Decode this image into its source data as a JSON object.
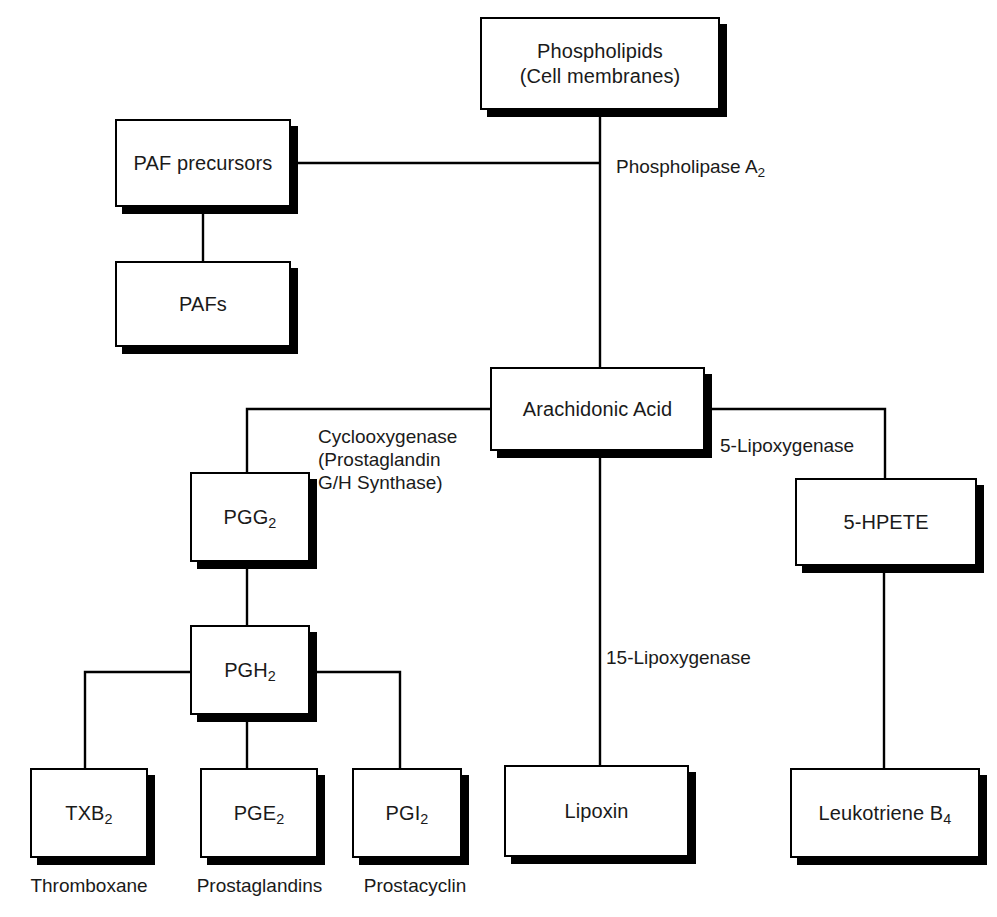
{
  "diagram": {
    "colors": {
      "box_fill": "#ffffff",
      "box_border": "#000000",
      "shadow": "#000000",
      "text": "#1a1a1a",
      "line": "#000000",
      "background": "#ffffff"
    },
    "nodes": [
      {
        "id": "phospholipids",
        "label": "Phospholipids\n(Cell membranes)",
        "x": 480,
        "y": 17,
        "w": 240,
        "h": 93
      },
      {
        "id": "paf_precursors",
        "label": "PAF precursors",
        "x": 115,
        "y": 119,
        "w": 176,
        "h": 88
      },
      {
        "id": "pafs",
        "label": "PAFs",
        "x": 115,
        "y": 261,
        "w": 176,
        "h": 86
      },
      {
        "id": "arachidonic",
        "label": "Arachidonic Acid",
        "x": 490,
        "y": 367,
        "w": 215,
        "h": 84
      },
      {
        "id": "pgg2",
        "label": "PGG₂",
        "x": 190,
        "y": 472,
        "w": 120,
        "h": 90
      },
      {
        "id": "hpete",
        "label": "5-HPETE",
        "x": 795,
        "y": 478,
        "w": 182,
        "h": 88
      },
      {
        "id": "pgh2",
        "label": "PGH₂",
        "x": 190,
        "y": 625,
        "w": 120,
        "h": 90
      },
      {
        "id": "txb2",
        "label": "TXB₂",
        "x": 30,
        "y": 768,
        "w": 118,
        "h": 90
      },
      {
        "id": "pge2",
        "label": "PGE₂",
        "x": 200,
        "y": 768,
        "w": 118,
        "h": 90
      },
      {
        "id": "pgi2",
        "label": "PGI₂",
        "x": 352,
        "y": 768,
        "w": 110,
        "h": 90
      },
      {
        "id": "lipoxin",
        "label": "Lipoxin",
        "x": 504,
        "y": 765,
        "w": 185,
        "h": 92
      },
      {
        "id": "leukotriene",
        "label": "Leukotriene B₄",
        "x": 790,
        "y": 768,
        "w": 190,
        "h": 90
      }
    ],
    "edge_labels": [
      {
        "id": "phospholipase_a2",
        "text": "Phospholipase A₂",
        "x": 616,
        "y": 155
      },
      {
        "id": "cyclooxygenase",
        "text": "Cyclooxygenase\n(Prostaglandin\nG/H Synthase)",
        "x": 318,
        "y": 425
      },
      {
        "id": "lipoxygenase_5",
        "text": "5-Lipoxygenase",
        "x": 720,
        "y": 434
      },
      {
        "id": "lipoxygenase_15",
        "text": "15-Lipoxygenase",
        "x": 606,
        "y": 646
      }
    ],
    "captions": [
      {
        "id": "thromboxane",
        "text": "Thromboxane",
        "x": 9,
        "y": 875,
        "w": 160
      },
      {
        "id": "prostaglandins",
        "text": "Prostaglandins",
        "x": 177,
        "y": 875,
        "w": 165
      },
      {
        "id": "prostacyclin",
        "text": "Prostacyclin",
        "x": 340,
        "y": 875,
        "w": 150
      }
    ],
    "connections": [
      {
        "id": "phospholipids-to-arachidonic",
        "from": "phospholipids",
        "to": "arachidonic",
        "path": "M 600 110 L 600 367"
      },
      {
        "id": "paf-precursors-to-trunk",
        "from": "paf_precursors",
        "to": "arachidonic",
        "path": "M 291 163 L 600 163"
      },
      {
        "id": "paf-precursors-to-pafs",
        "from": "paf_precursors",
        "to": "pafs",
        "path": "M 203 207 L 203 261"
      },
      {
        "id": "arachidonic-to-pgg2",
        "from": "arachidonic",
        "to": "pgg2",
        "path": "M 490 409 L 247 409 L 247 472"
      },
      {
        "id": "arachidonic-to-lipoxin",
        "from": "arachidonic",
        "to": "lipoxin",
        "path": "M 600 451 L 600 765"
      },
      {
        "id": "arachidonic-to-hpete",
        "from": "arachidonic",
        "to": "hpete",
        "path": "M 705 409 L 885 409 L 885 478"
      },
      {
        "id": "pgg2-to-pgh2",
        "from": "pgg2",
        "to": "pgh2",
        "path": "M 247 562 L 247 625"
      },
      {
        "id": "pgh2-to-txb2",
        "from": "pgh2",
        "to": "txb2",
        "path": "M 190 672 L 85 672 L 85 768"
      },
      {
        "id": "pgh2-to-pge2",
        "from": "pgh2",
        "to": "pge2",
        "path": "M 247 715 L 247 768"
      },
      {
        "id": "pgh2-to-pgi2",
        "from": "pgh2",
        "to": "pgi2",
        "path": "M 310 672 L 400 672 L 400 768"
      },
      {
        "id": "hpete-to-leukotriene",
        "from": "hpete",
        "to": "leukotriene",
        "path": "M 884 566 L 884 768"
      }
    ]
  }
}
